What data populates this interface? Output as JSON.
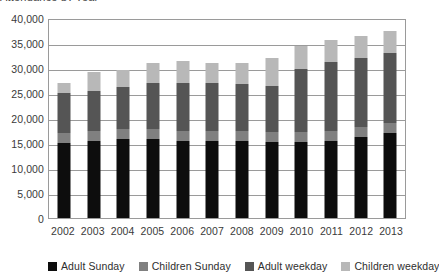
{
  "title_sliver": "Attendance by year",
  "chart_data": {
    "type": "bar",
    "stacked": true,
    "title": "",
    "xlabel": "",
    "ylabel": "",
    "ylim": [
      0,
      40000
    ],
    "ytick_step": 5000,
    "grid": true,
    "legend_position": "bottom",
    "categories": [
      "2002",
      "2003",
      "2004",
      "2005",
      "2006",
      "2007",
      "2008",
      "2009",
      "2010",
      "2011",
      "2012",
      "2013"
    ],
    "ytick_labels": [
      "40,000",
      "35,000",
      "30,000",
      "25,000",
      "20,000",
      "15,000",
      "10,000",
      "5,000",
      "0"
    ],
    "ytick_values": [
      40000,
      35000,
      30000,
      25000,
      20000,
      15000,
      10000,
      5000,
      0
    ],
    "series": [
      {
        "name": "Adult Sunday",
        "color": "#0d0d0d",
        "values": [
          15000,
          15400,
          15800,
          15900,
          15400,
          15400,
          15500,
          15300,
          15200,
          15500,
          16200,
          17000
        ]
      },
      {
        "name": "Children Sunday",
        "color": "#808080",
        "values": [
          2000,
          2000,
          2000,
          2000,
          2000,
          2000,
          2000,
          2000,
          2000,
          2000,
          2000,
          2000
        ]
      },
      {
        "name": "Adult weekday",
        "color": "#555555",
        "values": [
          8000,
          8000,
          8500,
          9100,
          9600,
          9600,
          9300,
          9200,
          12700,
          13700,
          13900,
          14000
        ]
      },
      {
        "name": "Children weekday",
        "color": "#b8b8b8",
        "values": [
          2000,
          3800,
          3400,
          4000,
          4400,
          4000,
          4200,
          5600,
          4500,
          4500,
          4300,
          4500
        ]
      }
    ],
    "totals": [
      27000,
      29200,
      29700,
      31000,
      31400,
      31000,
      31000,
      32100,
      34400,
      35700,
      36400,
      37500
    ]
  },
  "legend": {
    "items": [
      {
        "label": "Adult Sunday",
        "color": "#0d0d0d"
      },
      {
        "label": "Children Sunday",
        "color": "#808080"
      },
      {
        "label": "Adult weekday",
        "color": "#555555"
      },
      {
        "label": "Children weekday",
        "color": "#b8b8b8"
      }
    ]
  },
  "colors": {
    "axis": "#9a9a9a",
    "grid": "#9a9a9a",
    "text": "#3a3a3a",
    "background": "#ffffff"
  }
}
